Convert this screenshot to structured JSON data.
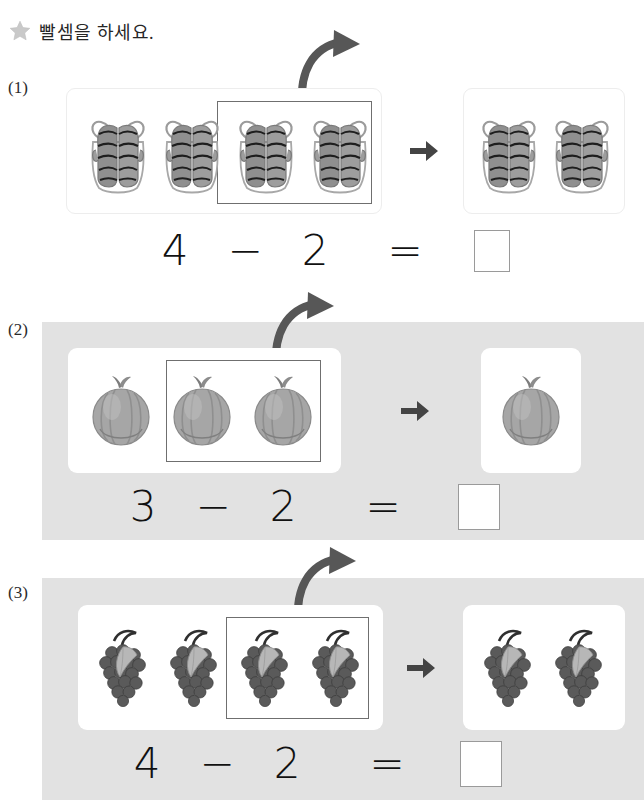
{
  "header": {
    "star_icon": "star-icon",
    "instruction": "빨셈을 하세요."
  },
  "problems": [
    {
      "label": "(1)",
      "item": "mitten",
      "item_name": "striped-mittens",
      "total_count": 4,
      "removed_count": 2,
      "remaining_count": 2,
      "equation": {
        "minuend": "4",
        "operator": "−",
        "subtrahend": "2",
        "equals": "=",
        "answer": ""
      },
      "panel_background": "#ffffff",
      "arrow_icon": "arrow-right-icon",
      "curved_arrow_icon": "curved-arrow-icon"
    },
    {
      "label": "(2)",
      "item": "pumpkin",
      "item_name": "gray-pumpkin",
      "total_count": 3,
      "removed_count": 2,
      "remaining_count": 1,
      "equation": {
        "minuend": "3",
        "operator": "−",
        "subtrahend": "2",
        "equals": "=",
        "answer": ""
      },
      "panel_background": "#e2e2e2",
      "arrow_icon": "arrow-right-icon",
      "curved_arrow_icon": "curved-arrow-icon"
    },
    {
      "label": "(3)",
      "item": "grapes",
      "item_name": "grape-bunch",
      "total_count": 4,
      "removed_count": 2,
      "remaining_count": 2,
      "equation": {
        "minuend": "4",
        "operator": "−",
        "subtrahend": "2",
        "equals": "=",
        "answer": ""
      },
      "panel_background": "#e2e2e2",
      "arrow_icon": "arrow-right-icon",
      "curved_arrow_icon": "curved-arrow-icon"
    }
  ],
  "colors": {
    "panel_gray": "#e2e2e2",
    "card_white": "#ffffff",
    "select_border": "#6f6f6f",
    "arrow_gray": "#555555",
    "star_gray": "#c9c9c9",
    "text_black": "#111111",
    "answer_border": "#9a9a9a"
  }
}
